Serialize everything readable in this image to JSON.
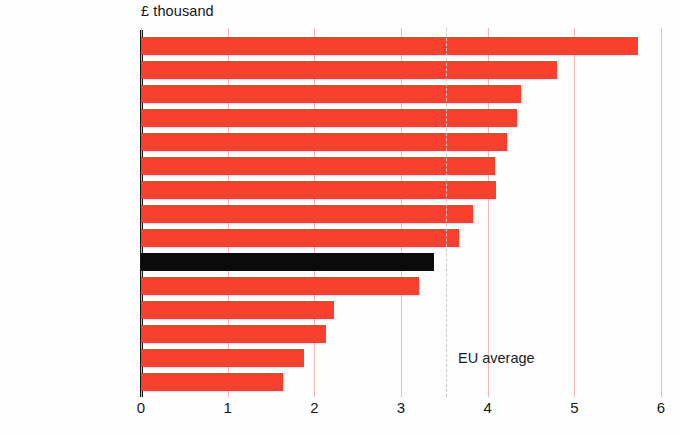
{
  "chart_data": {
    "type": "bar",
    "orientation": "horizontal",
    "title": "£ thousand",
    "xlabel": "",
    "ylabel": "",
    "xlim": [
      0,
      6
    ],
    "xticks": [
      "0",
      "1",
      "2",
      "3",
      "4",
      "5",
      "6"
    ],
    "grid": true,
    "legend": "none",
    "categories": [
      "Luxembourg",
      "Denmark",
      "Germany",
      "Sweden",
      "Austria",
      "Belgium",
      "Netherlands",
      "France",
      "Finland",
      "United Kingdom",
      "Italy",
      "Spain",
      "Irish Republic",
      "Greece",
      "Portugal"
    ],
    "values": [
      5.74,
      4.8,
      4.39,
      4.34,
      4.22,
      4.09,
      4.1,
      3.83,
      3.67,
      3.38,
      3.21,
      2.23,
      2.13,
      1.88,
      1.64
    ],
    "highlight_category": "United Kingdom",
    "annotations": [
      {
        "name": "eu-average",
        "label": "EU average",
        "value": 3.52,
        "style": "dashed-vertical-line"
      }
    ],
    "colors": {
      "bar": "#f93f2d",
      "highlight_bar": "#0b0b0b",
      "gridline": "#f0b9b6",
      "eu_line": "#c9c9c9",
      "axis": "#161616",
      "background": "#fdfdfd",
      "text": "#171717"
    }
  }
}
